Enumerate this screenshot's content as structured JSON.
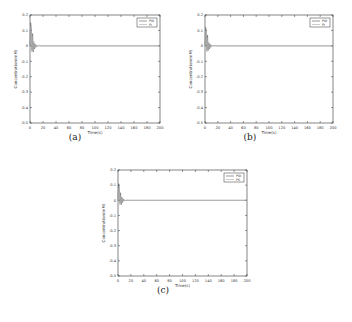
{
  "chart_data": [
    {
      "id": "a",
      "type": "line",
      "caption": "(a)",
      "title": "",
      "xlabel": "Time(s)",
      "ylabel": "Concentration(mM)",
      "xlim": [
        0,
        200
      ],
      "ylim": [
        -0.5,
        0.2
      ],
      "xticks": [
        0,
        20,
        40,
        60,
        80,
        100,
        120,
        140,
        160,
        180,
        200
      ],
      "yticks": [
        0.2,
        0.1,
        0,
        -0.1,
        -0.2,
        -0.3,
        -0.4,
        -0.5
      ],
      "grid": false,
      "legend_position": "upper right",
      "series": [
        {
          "name": "PID",
          "x": [
            0,
            1,
            2,
            3,
            4,
            5,
            6,
            7,
            8,
            9,
            10,
            12,
            14,
            16,
            20,
            30,
            200
          ],
          "values": [
            0,
            0.15,
            0.12,
            -0.03,
            0.08,
            -0.04,
            0.02,
            -0.02,
            0.01,
            -0.01,
            0.005,
            -0.003,
            0.002,
            0,
            0,
            0,
            0
          ]
        },
        {
          "name": "PI",
          "x": [
            0,
            1,
            2,
            3,
            4,
            5,
            6,
            7,
            8,
            9,
            10,
            12,
            14,
            16,
            20,
            30,
            200
          ],
          "values": [
            0,
            0.13,
            0.1,
            -0.04,
            0.06,
            -0.03,
            0.03,
            -0.015,
            0.012,
            -0.008,
            0.004,
            -0.002,
            0.001,
            0,
            0,
            0,
            0
          ]
        }
      ]
    },
    {
      "id": "b",
      "type": "line",
      "caption": "(b)",
      "title": "",
      "xlabel": "Time(s)",
      "ylabel": "Concentration(mM)",
      "xlim": [
        0,
        200
      ],
      "ylim": [
        -0.5,
        0.2
      ],
      "xticks": [
        0,
        20,
        40,
        60,
        80,
        100,
        120,
        140,
        160,
        180,
        200
      ],
      "yticks": [
        0.2,
        0.1,
        0,
        -0.1,
        -0.2,
        -0.3,
        -0.4,
        -0.5
      ],
      "grid": false,
      "legend_position": "upper right",
      "series": [
        {
          "name": "PID",
          "x": [
            0,
            1,
            2,
            3,
            4,
            5,
            6,
            7,
            8,
            9,
            10,
            12,
            14,
            16,
            20,
            30,
            200
          ],
          "values": [
            0,
            0.12,
            0.1,
            -0.03,
            0.07,
            -0.03,
            0.02,
            -0.02,
            0.01,
            -0.01,
            0.005,
            -0.002,
            0.001,
            0,
            0,
            0,
            0
          ]
        },
        {
          "name": "PI",
          "x": [
            0,
            1,
            2,
            3,
            4,
            5,
            6,
            7,
            8,
            9,
            10,
            12,
            14,
            16,
            20,
            30,
            200
          ],
          "values": [
            0,
            0.1,
            0.09,
            -0.04,
            0.05,
            -0.03,
            0.02,
            -0.015,
            0.01,
            -0.006,
            0.004,
            -0.002,
            0.001,
            0,
            0,
            0,
            0
          ]
        }
      ]
    },
    {
      "id": "c",
      "type": "line",
      "caption": "(c)",
      "title": "",
      "xlabel": "Time(s)",
      "ylabel": "Concentration(mM)",
      "xlim": [
        0,
        200
      ],
      "ylim": [
        -0.5,
        0.2
      ],
      "xticks": [
        0,
        20,
        40,
        60,
        80,
        100,
        120,
        140,
        160,
        180,
        200
      ],
      "yticks": [
        0.2,
        0.1,
        0,
        -0.1,
        -0.2,
        -0.3,
        -0.4,
        -0.5
      ],
      "grid": false,
      "legend_position": "upper right",
      "series": [
        {
          "name": "PID",
          "x": [
            0,
            1,
            2,
            3,
            4,
            5,
            6,
            7,
            8,
            9,
            10,
            12,
            14,
            16,
            20,
            30,
            200
          ],
          "values": [
            0,
            0.11,
            0.09,
            -0.02,
            0.05,
            -0.03,
            0.02,
            -0.015,
            0.01,
            -0.006,
            0.003,
            -0.002,
            0.001,
            0,
            0,
            0,
            0
          ]
        },
        {
          "name": "PS",
          "x": [
            0,
            1,
            2,
            3,
            4,
            5,
            6,
            7,
            8,
            9,
            10,
            12,
            14,
            16,
            20,
            30,
            200
          ],
          "values": [
            0,
            0.08,
            0.06,
            -0.03,
            0.03,
            -0.02,
            0.015,
            -0.01,
            0.006,
            -0.004,
            0.002,
            -0.001,
            0,
            0,
            0,
            0,
            0
          ]
        }
      ]
    }
  ],
  "layout": {
    "panels": [
      {
        "left": 30,
        "top": 15,
        "width": 130,
        "height": 108,
        "caption_x": 75,
        "caption_y": 138
      },
      {
        "left": 205,
        "top": 15,
        "width": 128,
        "height": 108,
        "caption_x": 250,
        "caption_y": 138
      },
      {
        "left": 118,
        "top": 170,
        "width": 129,
        "height": 106,
        "caption_x": 163,
        "caption_y": 291
      }
    ],
    "colors": {
      "axis": "#333333",
      "series_1": "#555555",
      "series_2": "#aaaaaa",
      "text": "#333333"
    }
  }
}
